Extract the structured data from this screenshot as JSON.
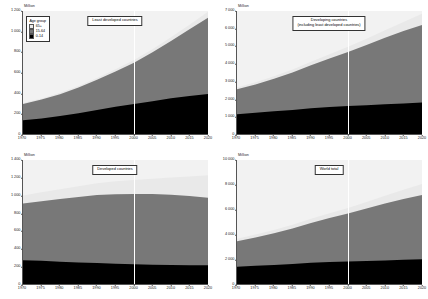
{
  "legend": {
    "title": "Age group",
    "items": [
      {
        "label": "65+",
        "color": "#e9e9e9"
      },
      {
        "label": "15-64",
        "color": "#787878"
      },
      {
        "label": "0-14",
        "color": "#000000"
      }
    ]
  },
  "axis_unit": "Million",
  "reference_year": 2000,
  "chart_data": [
    {
      "type": "area",
      "stacked": true,
      "title": "Least developed countries",
      "title_line2": "",
      "xlabel": "",
      "ylabel": "Million",
      "x": [
        1970,
        1975,
        1980,
        1985,
        1990,
        1995,
        2000,
        2005,
        2010,
        2015,
        2020
      ],
      "xticks": [
        "1970",
        "1975",
        "1980",
        "1985",
        "1990",
        "1995",
        "2000",
        "2005",
        "2010",
        "2015",
        "2020"
      ],
      "yticks": [
        "0",
        "200",
        "400",
        "600",
        "800",
        "1 000",
        "1 200"
      ],
      "ylim": [
        0,
        1200
      ],
      "xlim": [
        1970,
        2020
      ],
      "grid": false,
      "legend_position": "top-left",
      "series": [
        {
          "name": "0-14",
          "color": "#000000",
          "values": [
            133,
            152,
            175,
            203,
            235,
            265,
            292,
            320,
            348,
            371,
            390
          ]
        },
        {
          "name": "15-64",
          "color": "#787878",
          "values": [
            160,
            184,
            214,
            250,
            294,
            345,
            404,
            477,
            560,
            650,
            745
          ]
        },
        {
          "name": "65+",
          "color": "#e9e9e9",
          "values": [
            10,
            11,
            13,
            15,
            18,
            21,
            25,
            30,
            37,
            46,
            58
          ]
        }
      ]
    },
    {
      "type": "area",
      "stacked": true,
      "title": "Developing countries",
      "title_line2": "(including least developed countries)",
      "xlabel": "",
      "ylabel": "Million",
      "x": [
        1970,
        1975,
        1980,
        1985,
        1990,
        1995,
        2000,
        2005,
        2010,
        2015,
        2020
      ],
      "xticks": [
        "1970",
        "1975",
        "1980",
        "1985",
        "1990",
        "1995",
        "2000",
        "2005",
        "2010",
        "2015",
        "2020"
      ],
      "yticks": [
        "0",
        "1 000",
        "2 000",
        "3 000",
        "4 000",
        "5 000",
        "6 000",
        "7 000"
      ],
      "ylim": [
        0,
        7000
      ],
      "xlim": [
        1970,
        2020
      ],
      "grid": false,
      "legend_position": "none",
      "series": [
        {
          "name": "0-14",
          "color": "#000000",
          "values": [
            1120,
            1210,
            1290,
            1370,
            1470,
            1540,
            1590,
            1640,
            1690,
            1740,
            1790
          ]
        },
        {
          "name": "15-64",
          "color": "#787878",
          "values": [
            1420,
            1610,
            1850,
            2130,
            2440,
            2760,
            3080,
            3430,
            3790,
            4120,
            4410
          ]
        },
        {
          "name": "65+",
          "color": "#e9e9e9",
          "values": [
            110,
            128,
            150,
            176,
            207,
            245,
            290,
            350,
            425,
            520,
            640
          ]
        }
      ]
    },
    {
      "type": "area",
      "stacked": true,
      "title": "Developed countries",
      "title_line2": "",
      "xlabel": "",
      "ylabel": "Million",
      "x": [
        1970,
        1975,
        1980,
        1985,
        1990,
        1995,
        2000,
        2005,
        2010,
        2015,
        2020
      ],
      "xticks": [
        "1970",
        "1975",
        "1980",
        "1985",
        "1990",
        "1995",
        "2000",
        "2005",
        "2010",
        "2015",
        "2020"
      ],
      "yticks": [
        "0",
        "200",
        "400",
        "600",
        "800",
        "1 000",
        "1 200",
        "1 400"
      ],
      "ylim": [
        0,
        1400
      ],
      "xlim": [
        1970,
        2020
      ],
      "grid": false,
      "legend_position": "none",
      "series": [
        {
          "name": "0-14",
          "color": "#000000",
          "values": [
            268,
            262,
            252,
            243,
            238,
            230,
            222,
            216,
            214,
            213,
            212
          ]
        },
        {
          "name": "15-64",
          "color": "#787878",
          "values": [
            642,
            673,
            707,
            739,
            767,
            784,
            795,
            800,
            795,
            780,
            762
          ]
        },
        {
          "name": "65+",
          "color": "#e9e9e9",
          "values": [
            90,
            100,
            112,
            122,
            133,
            146,
            158,
            172,
            194,
            222,
            255
          ]
        }
      ]
    },
    {
      "type": "area",
      "stacked": true,
      "title": "World total",
      "title_line2": "",
      "xlabel": "",
      "ylabel": "Million",
      "x": [
        1970,
        1975,
        1980,
        1985,
        1990,
        1995,
        2000,
        2005,
        2010,
        2015,
        2020
      ],
      "xticks": [
        "1970",
        "1975",
        "1980",
        "1985",
        "1990",
        "1995",
        "2000",
        "2005",
        "2010",
        "2015",
        "2020"
      ],
      "yticks": [
        "0",
        "2 000",
        "4 000",
        "6 000",
        "8 000",
        "10 000"
      ],
      "ylim": [
        0,
        10000
      ],
      "xlim": [
        1970,
        2020
      ],
      "grid": false,
      "legend_position": "none",
      "series": [
        {
          "name": "0-14",
          "color": "#000000",
          "values": [
            1388,
            1472,
            1542,
            1613,
            1708,
            1770,
            1812,
            1856,
            1904,
            1953,
            2002
          ]
        },
        {
          "name": "15-64",
          "color": "#787878",
          "values": [
            2062,
            2283,
            2557,
            2869,
            3207,
            3544,
            3875,
            4230,
            4585,
            4900,
            5172
          ]
        },
        {
          "name": "65+",
          "color": "#e9e9e9",
          "values": [
            200,
            228,
            262,
            298,
            340,
            391,
            448,
            522,
            619,
            742,
            895
          ]
        }
      ]
    }
  ]
}
